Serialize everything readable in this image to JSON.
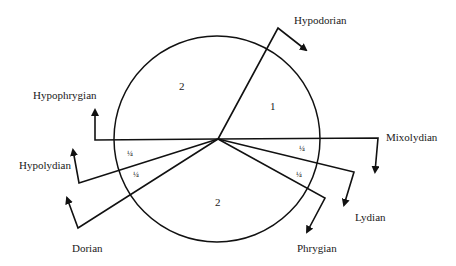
{
  "diagram": {
    "type": "modal-circle",
    "modes": [
      {
        "id": "hypodorian",
        "label": "Hypodorian"
      },
      {
        "id": "mixolydian",
        "label": "Mixolydian"
      },
      {
        "id": "lydian",
        "label": "Lydian"
      },
      {
        "id": "phrygian",
        "label": "Phrygian"
      },
      {
        "id": "dorian",
        "label": "Dorian"
      },
      {
        "id": "hypolydian",
        "label": "Hypolydian"
      },
      {
        "id": "hypophrygian",
        "label": "Hypophrygian"
      }
    ],
    "sectors": [
      {
        "id": "upper-left",
        "label": "2",
        "between": [
          "hypophrygian",
          "hypodorian"
        ]
      },
      {
        "id": "upper-right",
        "label": "1",
        "between": [
          "hypodorian",
          "mixolydian"
        ]
      },
      {
        "id": "right-quarter-1",
        "label": "1/4",
        "display": "¼",
        "between": [
          "mixolydian",
          "lydian"
        ]
      },
      {
        "id": "right-quarter-2",
        "label": "1/4",
        "display": "¼",
        "between": [
          "lydian",
          "phrygian"
        ]
      },
      {
        "id": "bottom",
        "label": "2",
        "between": [
          "phrygian",
          "dorian"
        ]
      },
      {
        "id": "left-quarter-2",
        "label": "1/4",
        "display": "¼",
        "between": [
          "dorian",
          "hypolydian"
        ]
      },
      {
        "id": "left-quarter-1",
        "label": "1/4",
        "display": "¼",
        "between": [
          "hypolydian",
          "hypophrygian"
        ]
      }
    ],
    "colors": {
      "stroke": "#111111",
      "background": "#ffffff"
    }
  }
}
